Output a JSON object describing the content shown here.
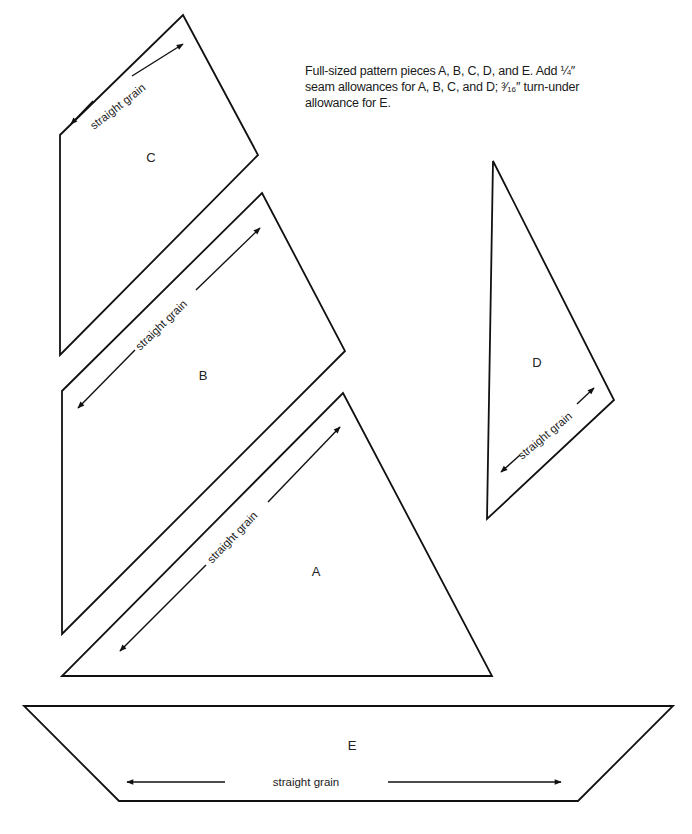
{
  "instructions": {
    "line1": "Full-sized pattern pieces A, B, C, D, and E. Add ¼″",
    "line2": "seam allowances for A, B, C, and D; ³⁄₁₆″ turn-under",
    "line3": "allowance for E."
  },
  "pieces": {
    "A": {
      "label": "A",
      "grain": "straight grain"
    },
    "B": {
      "label": "B",
      "grain": "straight grain"
    },
    "C": {
      "label": "C",
      "grain": "straight grain"
    },
    "D": {
      "label": "D",
      "grain": "straight grain"
    },
    "E": {
      "label": "E",
      "grain": "straight grain"
    }
  },
  "colors": {
    "line": "#111111",
    "background": "#ffffff"
  }
}
